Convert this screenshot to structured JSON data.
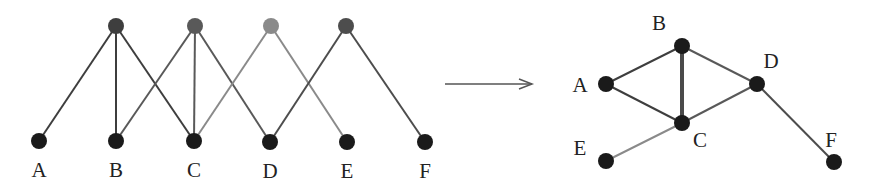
{
  "bipartite": {
    "top_nodes": [
      {
        "id": "t1",
        "x": 116,
        "y": 26,
        "color": "#3e3e3e"
      },
      {
        "id": "t2",
        "x": 195,
        "y": 26,
        "color": "#595959"
      },
      {
        "id": "t3",
        "x": 271,
        "y": 26,
        "color": "#8a8a8a"
      },
      {
        "id": "t4",
        "x": 346,
        "y": 26,
        "color": "#4d4d4d"
      }
    ],
    "bottom_nodes": [
      {
        "id": "A",
        "label": "A",
        "x": 39,
        "y": 141
      },
      {
        "id": "B",
        "label": "B",
        "x": 116,
        "y": 141
      },
      {
        "id": "C",
        "label": "C",
        "x": 194,
        "y": 141
      },
      {
        "id": "D",
        "label": "D",
        "x": 270,
        "y": 142
      },
      {
        "id": "E",
        "label": "E",
        "x": 347,
        "y": 142
      },
      {
        "id": "F",
        "label": "F",
        "x": 425,
        "y": 142
      }
    ],
    "edges": [
      {
        "from": "t1",
        "to": "A",
        "color": "#3e3e3e"
      },
      {
        "from": "t1",
        "to": "B",
        "color": "#3e3e3e"
      },
      {
        "from": "t1",
        "to": "C",
        "color": "#3e3e3e"
      },
      {
        "from": "t2",
        "to": "B",
        "color": "#595959"
      },
      {
        "from": "t2",
        "to": "C",
        "color": "#595959"
      },
      {
        "from": "t2",
        "to": "D",
        "color": "#595959"
      },
      {
        "from": "t3",
        "to": "C",
        "color": "#8a8a8a"
      },
      {
        "from": "t3",
        "to": "E",
        "color": "#8a8a8a"
      },
      {
        "from": "t4",
        "to": "D",
        "color": "#4d4d4d"
      },
      {
        "from": "t4",
        "to": "F",
        "color": "#4d4d4d"
      }
    ],
    "label_offset_y": 30
  },
  "arrow": {
    "x1": 445,
    "y1": 84,
    "x2": 532,
    "y2": 84,
    "color": "#555555"
  },
  "projection": {
    "nodes": [
      {
        "id": "A",
        "label": "A",
        "x": 606,
        "y": 84,
        "lx": 580,
        "ly": 92
      },
      {
        "id": "B",
        "label": "B",
        "x": 682,
        "y": 46,
        "lx": 659,
        "ly": 30
      },
      {
        "id": "C",
        "label": "C",
        "x": 682,
        "y": 123,
        "lx": 700,
        "ly": 147
      },
      {
        "id": "D",
        "label": "D",
        "x": 757,
        "y": 84,
        "lx": 771,
        "ly": 68
      },
      {
        "id": "E",
        "label": "E",
        "x": 606,
        "y": 161,
        "lx": 580,
        "ly": 155
      },
      {
        "id": "F",
        "label": "F",
        "x": 834,
        "y": 162,
        "lx": 831,
        "ly": 147
      }
    ],
    "edges": [
      {
        "from": "A",
        "to": "B",
        "color": "#3e3e3e",
        "width": 2
      },
      {
        "from": "A",
        "to": "C",
        "color": "#3e3e3e",
        "width": 2
      },
      {
        "from": "B",
        "to": "C",
        "color": "#4a4a4a",
        "width": 4
      },
      {
        "from": "B",
        "to": "D",
        "color": "#595959",
        "width": 2
      },
      {
        "from": "C",
        "to": "D",
        "color": "#595959",
        "width": 2
      },
      {
        "from": "C",
        "to": "E",
        "color": "#8a8a8a",
        "width": 2
      },
      {
        "from": "D",
        "to": "F",
        "color": "#4d4d4d",
        "width": 2
      }
    ]
  },
  "node_color": "#1a1a1a",
  "node_radius": 8
}
